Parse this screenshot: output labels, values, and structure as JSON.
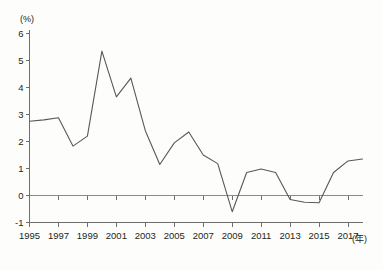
{
  "chart_data": {
    "type": "line",
    "title": "",
    "subtitle": "",
    "xlabel": "(年)",
    "ylabel": "(%)",
    "x": [
      1995,
      1996,
      1997,
      1998,
      1999,
      2000,
      2001,
      2002,
      2003,
      2004,
      2005,
      2006,
      2007,
      2008,
      2009,
      2010,
      2011,
      2012,
      2013,
      2014,
      2015,
      2016,
      2017,
      2018
    ],
    "values": [
      2.75,
      2.8,
      2.88,
      1.83,
      2.2,
      5.35,
      3.65,
      4.35,
      2.4,
      1.15,
      1.95,
      2.35,
      1.5,
      1.18,
      -0.6,
      0.85,
      0.98,
      0.85,
      -0.15,
      -0.25,
      -0.27,
      0.85,
      1.28,
      1.35
    ],
    "series": [
      {
        "name": "",
        "color": "#58585a",
        "values": [
          2.75,
          2.8,
          2.88,
          1.83,
          2.2,
          5.35,
          3.65,
          4.35,
          2.4,
          1.15,
          1.95,
          2.35,
          1.5,
          1.18,
          -0.6,
          0.85,
          0.98,
          0.85,
          -0.15,
          -0.25,
          -0.27,
          0.85,
          1.28,
          1.35
        ]
      }
    ],
    "ylim": [
      -1,
      6
    ],
    "xlim": [
      1995,
      2018
    ],
    "ytick_values": [
      -1,
      0,
      1,
      2,
      3,
      4,
      5,
      6
    ],
    "ytick_labels": [
      "-1",
      "0",
      "1",
      "2",
      "3",
      "4",
      "5",
      "6"
    ],
    "xtick_values": [
      1995,
      1997,
      1999,
      2001,
      2003,
      2005,
      2007,
      2009,
      2011,
      2013,
      2015,
      2017
    ],
    "xtick_labels": [
      "1995",
      "1997",
      "1999",
      "2001",
      "2003",
      "2005",
      "2007",
      "2009",
      "2011",
      "2013",
      "2015",
      "2017"
    ],
    "grid": false,
    "legend": "none",
    "zero_reference_line": 0
  },
  "axis": {
    "y_unit": "(%)",
    "x_unit": "(年)"
  }
}
